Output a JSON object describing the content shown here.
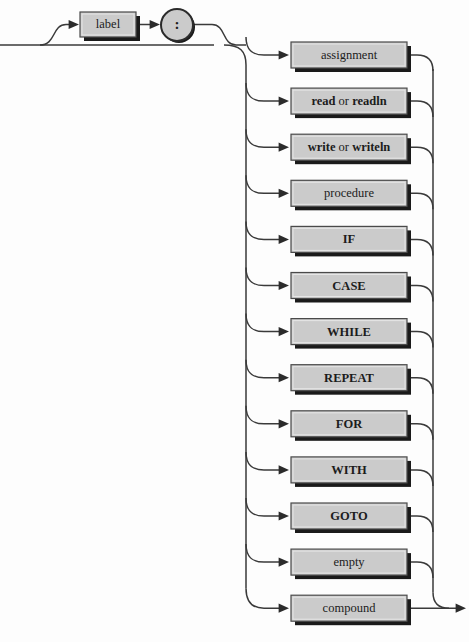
{
  "diagram": {
    "type": "railroad-syntax-diagram",
    "colors": {
      "background": "#fdfdfd",
      "box_fill": "#cbcbcb",
      "box_border": "#4a4a4a",
      "shadow": "#1a1a1a",
      "rail": "#3a3a3a",
      "text": "#1c1c1c"
    },
    "prefix": {
      "label_box": {
        "text": "label",
        "bold": false,
        "x": 80,
        "y": 12,
        "width": 56,
        "height": 25
      },
      "colon_node": {
        "text": ":",
        "cx": 177,
        "cy": 25,
        "r": 16
      }
    },
    "alternatives": [
      {
        "text": "assignment",
        "bold": false,
        "segments": [
          {
            "t": "assignment",
            "b": false
          }
        ]
      },
      {
        "text": "read or readln",
        "bold": true,
        "segments": [
          {
            "t": "read",
            "b": true
          },
          {
            "t": " or ",
            "b": false
          },
          {
            "t": "readln",
            "b": true
          }
        ]
      },
      {
        "text": "write or writeln",
        "bold": true,
        "segments": [
          {
            "t": "write",
            "b": true
          },
          {
            "t": " or ",
            "b": false
          },
          {
            "t": "writeln",
            "b": true
          }
        ]
      },
      {
        "text": "procedure",
        "bold": false,
        "segments": [
          {
            "t": "procedure",
            "b": false
          }
        ]
      },
      {
        "text": "IF",
        "bold": true,
        "segments": [
          {
            "t": "IF",
            "b": true
          }
        ]
      },
      {
        "text": "CASE",
        "bold": true,
        "segments": [
          {
            "t": "CASE",
            "b": true
          }
        ]
      },
      {
        "text": "WHILE",
        "bold": true,
        "segments": [
          {
            "t": "WHILE",
            "b": true
          }
        ]
      },
      {
        "text": "REPEAT",
        "bold": true,
        "segments": [
          {
            "t": "REPEAT",
            "b": true
          }
        ]
      },
      {
        "text": "FOR",
        "bold": true,
        "segments": [
          {
            "t": "FOR",
            "b": true
          }
        ]
      },
      {
        "text": "WITH",
        "bold": true,
        "segments": [
          {
            "t": "WITH",
            "b": true
          }
        ]
      },
      {
        "text": "GOTO",
        "bold": true,
        "segments": [
          {
            "t": "GOTO",
            "b": true
          }
        ]
      },
      {
        "text": "empty",
        "bold": false,
        "segments": [
          {
            "t": "empty",
            "b": false
          }
        ]
      },
      {
        "text": "compound",
        "bold": false,
        "segments": [
          {
            "t": "compound",
            "b": false
          }
        ]
      }
    ],
    "geometry": {
      "entry_line_y": 45,
      "left_rail_x": 246,
      "right_rail_x": 433,
      "box_left": 291,
      "box_width": 116,
      "box_height": 26,
      "first_box_top": 42,
      "box_pitch": 46.1,
      "exit_arrow_x": 466
    }
  }
}
